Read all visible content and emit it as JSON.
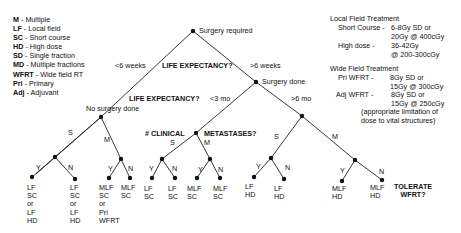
{
  "legend": [
    {
      "abbr": "M",
      "desc": " - Multiple"
    },
    {
      "abbr": "LF",
      "desc": " - Local field"
    },
    {
      "abbr": "SC",
      "desc": " - Short course"
    },
    {
      "abbr": "HD",
      "desc": " - High dose"
    },
    {
      "abbr": "SD",
      "desc": " - Single fraction"
    },
    {
      "abbr": "MD",
      "desc": " - Multiple fractions"
    },
    {
      "abbr": "WFRT",
      "desc": " - Wide field RT"
    },
    {
      "abbr": "Pri",
      "desc": " - Primary"
    },
    {
      "abbr": "Adj",
      "desc": " - Adjuvant"
    }
  ],
  "notes": {
    "local_title": "Local Field Treatment",
    "short_course_label": "Short Course -",
    "short_course_value": "6-8Gy SD or\n20Gy @ 400cGy",
    "high_dose_label": "High dose -",
    "high_dose_value": "36-42Gy\n@ 200-300cGy",
    "wide_title": "Wide Field Treatment",
    "pri_label": "Pri WFRT -",
    "pri_value": "8Gy SD or\n15Gy @ 300cGy",
    "adj_label": "Adj WFRT -",
    "adj_value": "8Gy SD or\n15Gy @ 250cGy",
    "caveat": "(appropriate limitation of\ndose to vital structures)"
  },
  "tree": {
    "root_label": "Surgery required",
    "less_6_weeks": "<6 weeks",
    "more_6_weeks": ">6 weeks",
    "life_expectancy_1": "LIFE EXPECTANCY?",
    "no_surgery_label": "No surgery done",
    "surgery_done_label": "Surgery done",
    "life_expectancy_2": "LIFE EXPECTANCY?",
    "less_3_mo": "<3 mo",
    "more_6_mo": ">6 mo",
    "clinical_label": "# CLINICAL",
    "metastases_label": "METASTASES?",
    "tolerate_label": "TOLERATE\nWFRT?",
    "branch_S": "S",
    "branch_M": "M",
    "branch_Y": "Y",
    "branch_N": "N",
    "leaves": [
      "LF\nSC\nor\nLF\nHD",
      "LF\nSC\nor\nLF\nHD",
      "MLF\nSC\nor\nPri\nWFRT",
      "MLF\nSC",
      "LF\nSC",
      "LF\nSC",
      "MLF\nSC",
      "MLF\nSC",
      "LF\nHD",
      "LF\nHD",
      "MLF\nHD",
      "MLF\nHD"
    ]
  }
}
